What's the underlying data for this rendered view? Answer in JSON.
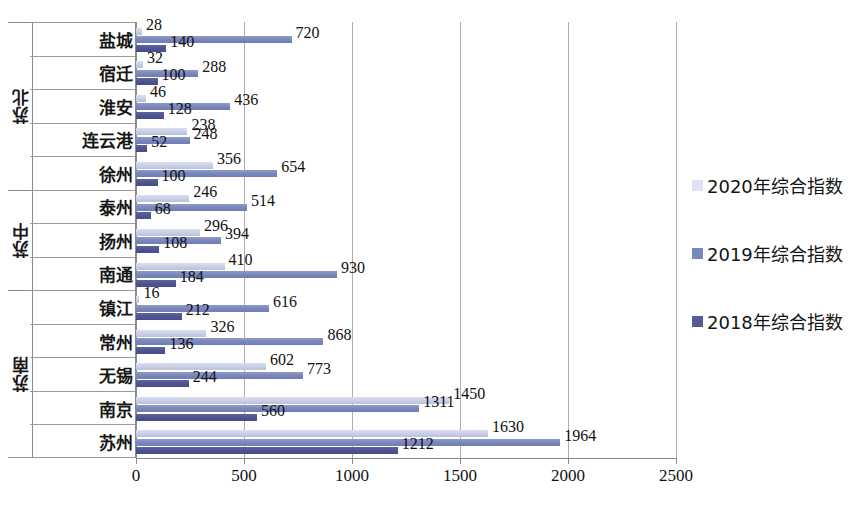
{
  "chart_data": {
    "type": "bar",
    "orientation": "horizontal",
    "title": "",
    "xlabel": "",
    "ylabel": "",
    "xlim": [
      0,
      2500
    ],
    "xticks": [
      0,
      500,
      1000,
      1500,
      2000,
      2500
    ],
    "xtick_labels": [
      "0",
      "500",
      "1000",
      "1500",
      "2000",
      "2500"
    ],
    "grid": true,
    "legend_position": "right",
    "categories": [
      "盐城",
      "宿迁",
      "淮安",
      "连云港",
      "徐州",
      "泰州",
      "扬州",
      "南通",
      "镇江",
      "常州",
      "无锡",
      "南京",
      "苏州"
    ],
    "groups": [
      {
        "label": "苏北",
        "categories": [
          "盐城",
          "宿迁",
          "淮安",
          "连云港",
          "徐州"
        ]
      },
      {
        "label": "苏中",
        "categories": [
          "泰州",
          "扬州",
          "南通"
        ]
      },
      {
        "label": "苏南",
        "categories": [
          "镇江",
          "常州",
          "无锡",
          "南京",
          "苏州"
        ]
      }
    ],
    "series": [
      {
        "name": "2020年综合指数",
        "color": "#dfe2f1",
        "values": [
          28,
          32,
          46,
          238,
          356,
          246,
          296,
          410,
          16,
          326,
          602,
          1450,
          1630
        ]
      },
      {
        "name": "2019年综合指数",
        "color": "#7b88be",
        "values": [
          720,
          288,
          436,
          248,
          654,
          514,
          394,
          930,
          616,
          868,
          773,
          1311,
          1964
        ]
      },
      {
        "name": "2018年综合指数",
        "color": "#545a95",
        "values": [
          140,
          100,
          128,
          52,
          100,
          68,
          108,
          184,
          212,
          136,
          244,
          560,
          1212
        ]
      }
    ]
  },
  "legend": {
    "items": [
      {
        "label": "2020年综合指数",
        "swatch": "y2020"
      },
      {
        "label": "2019年综合指数",
        "swatch": "y2019"
      },
      {
        "label": "2018年综合指数",
        "swatch": "y2018"
      }
    ]
  },
  "colors": {
    "series_2020": "#dfe2f1",
    "series_2019": "#7b88be",
    "series_2018": "#545a95",
    "gridline": "#b9a9a9",
    "axis": "#8a8a8a"
  }
}
